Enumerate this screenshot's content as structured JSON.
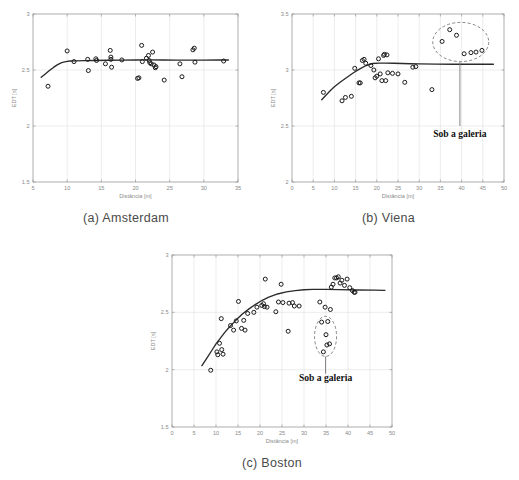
{
  "figure": {
    "title_present": false,
    "panels": [
      {
        "id": "amsterdam",
        "caption": "(a) Amsterdam",
        "annotation": null
      },
      {
        "id": "viena",
        "caption": "(b) Viena",
        "annotation": "Sob a galeria"
      },
      {
        "id": "boston",
        "caption": "(c) Boston",
        "annotation": "Sob a galeria"
      }
    ]
  },
  "colors": {
    "marker_stroke": "#1a1a1a",
    "fit_line": "#2b2b2b",
    "grid": "#d9d9d9",
    "axis": "#9a9a9a",
    "tick_text": "#8a8a8a",
    "annotation_text": "#111111",
    "caption_text": "#4a4a4a",
    "background": "#ffffff"
  },
  "chart_data": [
    {
      "type": "scatter",
      "id": "amsterdam",
      "title": "(a) Amsterdam",
      "xlabel": "Distância [m]",
      "ylabel": "EDT [s]",
      "xlim": [
        5,
        35
      ],
      "ylim": [
        1.5,
        3
      ],
      "xticks": [
        5,
        10,
        15,
        20,
        25,
        30,
        35
      ],
      "xticklabels": [
        "5",
        "10",
        "15",
        "20",
        "25",
        "30",
        "35"
      ],
      "yticks": [
        1.5,
        2,
        2.5,
        3
      ],
      "yticklabels": [
        "1.5",
        "2",
        "2.5",
        "3"
      ],
      "grid": true,
      "legend": null,
      "series": [
        {
          "name": "EDT measurements",
          "marker": "open-circle",
          "x": [
            7.2,
            10.0,
            11.0,
            13.0,
            13.1,
            14.2,
            14.3,
            15.6,
            16.3,
            16.4,
            16.4,
            16.5,
            18.0,
            20.3,
            20.5,
            20.9,
            21.0,
            21.6,
            21.9,
            22.0,
            22.1,
            22.3,
            22.5,
            22.7,
            22.9,
            23.0,
            24.2,
            26.5,
            26.8,
            28.4,
            28.6,
            28.7,
            32.9
          ],
          "y": [
            2.355,
            2.67,
            2.575,
            2.595,
            2.495,
            2.6,
            2.585,
            2.555,
            2.675,
            2.615,
            2.595,
            2.525,
            2.59,
            2.425,
            2.43,
            2.72,
            2.575,
            2.605,
            2.63,
            2.585,
            2.565,
            2.555,
            2.66,
            2.545,
            2.52,
            2.53,
            2.41,
            2.555,
            2.44,
            2.68,
            2.695,
            2.57,
            2.58
          ]
        }
      ],
      "fit_line": {
        "name": "regression fit",
        "x": [
          6.2,
          6.8,
          7.4,
          8.0,
          8.6,
          9.2,
          9.8,
          10.4,
          11.2,
          12.5,
          14.0,
          16.0,
          18.0,
          20.0,
          22.0,
          24.0,
          26.0,
          28.0,
          30.0,
          32.0,
          33.6
        ],
        "y": [
          2.435,
          2.465,
          2.495,
          2.523,
          2.548,
          2.565,
          2.575,
          2.58,
          2.582,
          2.583,
          2.585,
          2.587,
          2.588,
          2.589,
          2.59,
          2.589,
          2.588,
          2.588,
          2.588,
          2.589,
          2.589
        ]
      },
      "highlight_ellipse": null,
      "annotation": null
    },
    {
      "type": "scatter",
      "id": "viena",
      "title": "(b) Viena",
      "xlabel": "Distância [m]",
      "ylabel": "EDT [s]",
      "xlim": [
        0,
        50
      ],
      "ylim": [
        2,
        3.5
      ],
      "xticks": [
        0,
        5,
        10,
        15,
        20,
        25,
        30,
        35,
        40,
        45,
        50
      ],
      "xticklabels": [
        "0",
        "5",
        "10",
        "15",
        "20",
        "25",
        "30",
        "35",
        "40",
        "45",
        "50"
      ],
      "yticks": [
        2,
        2.5,
        3,
        3.5
      ],
      "yticklabels": [
        "2",
        "2.5",
        "3",
        "3.5"
      ],
      "grid": true,
      "legend": null,
      "series": [
        {
          "name": "EDT measurements",
          "marker": "open-circle",
          "x": [
            7.4,
            11.8,
            12.6,
            14.0,
            14.8,
            15.8,
            16.1,
            16.6,
            17.0,
            17.4,
            18.6,
            19.3,
            19.6,
            20.0,
            20.4,
            20.8,
            21.2,
            21.6,
            21.8,
            22.1,
            22.4,
            22.6,
            23.7,
            25.0,
            26.6,
            28.5,
            29.2,
            33.0
          ],
          "y": [
            2.8,
            2.725,
            2.755,
            2.765,
            3.015,
            2.885,
            2.885,
            3.085,
            3.095,
            3.06,
            3.04,
            3.0,
            2.93,
            2.945,
            3.1,
            2.965,
            2.905,
            3.13,
            3.14,
            2.905,
            3.135,
            2.975,
            2.97,
            2.965,
            2.89,
            3.025,
            3.03,
            2.825
          ]
        },
        {
          "name": "Sob a galeria (under balcony)",
          "marker": "open-circle",
          "x": [
            35.4,
            37.2,
            38.8,
            40.6,
            42.2,
            43.4,
            44.8
          ],
          "y": [
            3.255,
            3.36,
            3.31,
            3.145,
            3.155,
            3.16,
            3.175
          ]
        }
      ],
      "fit_line": {
        "name": "regression fit",
        "x": [
          7.0,
          8.0,
          9.0,
          10.0,
          11.5,
          13.0,
          14.5,
          16.0,
          17.5,
          19.0,
          20.5,
          22.0,
          24.0,
          26.0,
          28.0,
          30.0,
          34.0,
          38.0,
          42.0,
          46.0,
          47.5
        ],
        "y": [
          2.735,
          2.775,
          2.815,
          2.85,
          2.895,
          2.935,
          2.975,
          3.01,
          3.04,
          3.058,
          3.062,
          3.062,
          3.06,
          3.058,
          3.056,
          3.054,
          3.052,
          3.051,
          3.051,
          3.051,
          3.051
        ]
      },
      "highlight_ellipse": {
        "label": "Sob a galeria",
        "cx": 39.8,
        "cy": 3.25,
        "rx": 6.6,
        "ry": 0.175,
        "style": "dashed"
      },
      "annotation": {
        "text": "Sob a galeria",
        "text_x": 39.6,
        "text_y": 2.4,
        "leader_from_x": 39.6,
        "leader_from_y": 3.07,
        "leader_to_x": 39.6,
        "leader_to_y": 2.5
      }
    },
    {
      "type": "scatter",
      "id": "boston",
      "title": "(c) Boston",
      "xlabel": "Distância [m]",
      "ylabel": "EDT [s]",
      "xlim": [
        0,
        50
      ],
      "ylim": [
        1.5,
        3
      ],
      "xticks": [
        0,
        5,
        10,
        15,
        20,
        25,
        30,
        35,
        40,
        45,
        50
      ],
      "xticklabels": [
        "0",
        "5",
        "10",
        "15",
        "20",
        "25",
        "30",
        "35",
        "40",
        "45",
        "50"
      ],
      "yticks": [
        1.5,
        2,
        2.5,
        3
      ],
      "yticklabels": [
        "1.5",
        "2",
        "2.5",
        "3"
      ],
      "grid": true,
      "legend": null,
      "series": [
        {
          "name": "EDT measurements",
          "marker": "open-circle",
          "x": [
            8.8,
            10.2,
            10.4,
            10.8,
            11.2,
            11.3,
            11.6,
            13.3,
            14.0,
            14.6,
            15.1,
            15.8,
            16.3,
            16.6,
            17.2,
            18.6,
            19.3,
            20.4,
            20.8,
            21.0,
            21.2,
            21.6,
            23.6,
            24.2,
            24.8,
            25.2,
            26.4,
            26.6,
            27.4,
            27.8,
            28.9,
            33.6,
            34.8,
            36.0,
            36.2,
            36.6,
            37.0,
            37.4,
            37.8,
            38.2,
            38.6,
            39.2,
            39.8,
            40.4,
            41.0,
            41.4,
            41.6
          ],
          "y": [
            1.995,
            2.155,
            2.13,
            2.23,
            2.445,
            2.175,
            2.135,
            2.385,
            2.345,
            2.425,
            2.595,
            2.36,
            2.43,
            2.345,
            2.49,
            2.5,
            2.545,
            2.56,
            2.575,
            2.55,
            2.79,
            2.545,
            2.505,
            2.59,
            2.745,
            2.585,
            2.335,
            2.58,
            2.585,
            2.555,
            2.555,
            2.59,
            2.545,
            2.525,
            2.72,
            2.745,
            2.8,
            2.8,
            2.81,
            2.755,
            2.78,
            2.735,
            2.79,
            2.715,
            2.69,
            2.675,
            2.675
          ]
        },
        {
          "name": "Sob a galeria (under balcony)",
          "marker": "open-circle",
          "x": [
            34.0,
            35.4,
            35.0,
            35.2,
            35.8,
            34.4
          ],
          "y": [
            2.415,
            2.42,
            2.305,
            2.215,
            2.225,
            2.155
          ]
        }
      ],
      "fit_line": {
        "name": "regression fit",
        "x": [
          6.8,
          8.0,
          9.0,
          10.0,
          11.0,
          12.0,
          13.0,
          14.5,
          16.0,
          17.5,
          19.0,
          20.5,
          22.0,
          24.0,
          26.0,
          28.0,
          30.0,
          32.0,
          35.0,
          38.0,
          42.0,
          46.0,
          48.4
        ],
        "y": [
          2.035,
          2.105,
          2.165,
          2.225,
          2.275,
          2.325,
          2.37,
          2.43,
          2.485,
          2.53,
          2.57,
          2.605,
          2.632,
          2.66,
          2.678,
          2.69,
          2.697,
          2.7,
          2.7,
          2.698,
          2.695,
          2.693,
          2.692
        ]
      },
      "highlight_ellipse": {
        "label": "Sob a galeria",
        "cx": 34.9,
        "cy": 2.29,
        "rx": 2.5,
        "ry": 0.175,
        "style": "dashed"
      },
      "annotation": {
        "text": "Sob a galeria",
        "text_x": 34.9,
        "text_y": 1.9,
        "leader_from_x": 34.9,
        "leader_from_y": 2.115,
        "leader_to_x": 34.9,
        "leader_to_y": 1.965
      }
    }
  ]
}
